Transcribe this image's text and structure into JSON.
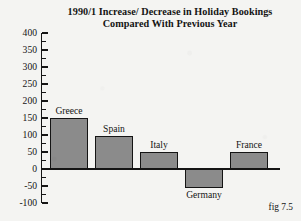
{
  "chart_data": {
    "type": "bar",
    "title": "1990/1 Increase/ Decrease in Holiday Bookings Compared With Previous Year",
    "title_lines": [
      "1990/1 Increase/ Decrease in Holiday Bookings",
      "Compared With Previous Year"
    ],
    "xlabel": "",
    "ylabel": "",
    "ylim": [
      -100,
      400
    ],
    "ytick_step": 50,
    "minor_ticks": true,
    "grid": false,
    "legend": "none",
    "categories": [
      "Greece",
      "Spain",
      "Italy",
      "Germany",
      "France"
    ],
    "values": [
      150,
      97,
      50,
      -55,
      50
    ],
    "ytick_labels": [
      "400",
      "350",
      "300",
      "250",
      "200",
      "150",
      "100",
      "50",
      "0",
      "-50",
      "-100"
    ],
    "ytick_values": [
      400,
      350,
      300,
      250,
      200,
      150,
      100,
      50,
      0,
      -50,
      -100
    ],
    "bar_color": "#8b8b8b",
    "bar_border_color": "#141414",
    "axis_color": "#151515",
    "background_color": "#f4f4f2",
    "data_label_position": "outside",
    "caption": "fig 7.5"
  }
}
